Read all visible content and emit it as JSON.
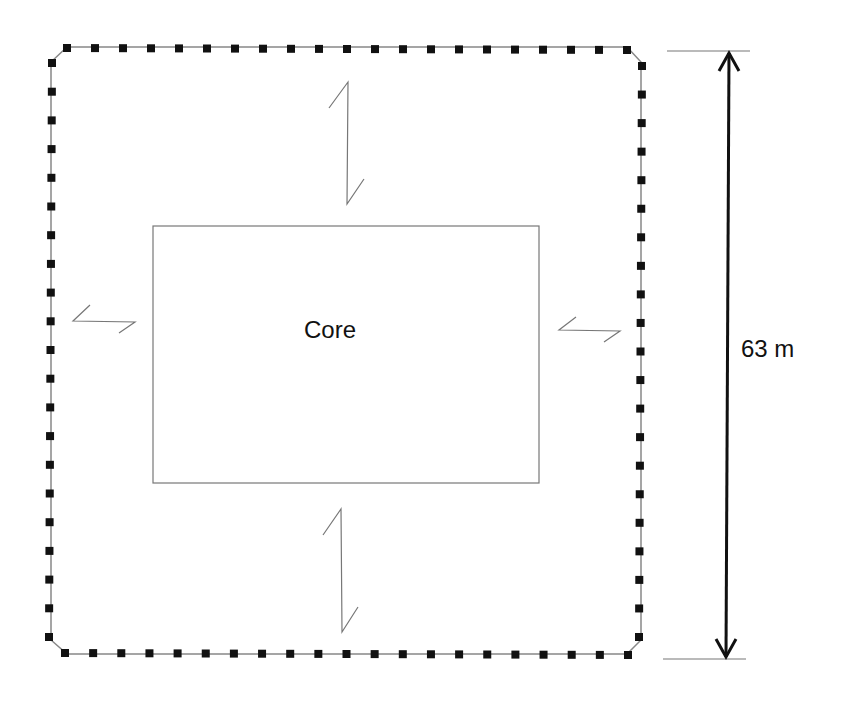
{
  "diagram": {
    "core": {
      "label": "Core",
      "x": 153,
      "y": 226,
      "w": 386,
      "h": 257
    },
    "dimension": {
      "label": "63 m",
      "x": 723,
      "top": 51,
      "bottom": 659
    },
    "perimeter": {
      "style": "dashed columns (black squares) on thin line",
      "top_y": 48,
      "bottom_y": 654,
      "left_x": 51,
      "right_x": 641,
      "columns_per_long_edge": 21
    },
    "bracing_arrows": [
      {
        "id": "top",
        "orientation": "vertical"
      },
      {
        "id": "bottom",
        "orientation": "vertical"
      },
      {
        "id": "left",
        "orientation": "horizontal"
      },
      {
        "id": "right",
        "orientation": "horizontal"
      }
    ],
    "colors": {
      "stroke": "#111111",
      "thin": "#777777",
      "background": "#ffffff"
    }
  }
}
